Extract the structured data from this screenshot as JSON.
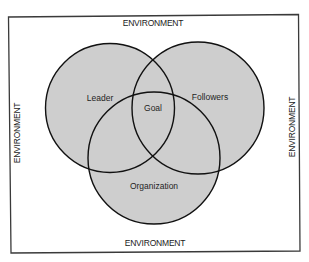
{
  "diagram": {
    "type": "venn",
    "frame": {
      "stroke": "#3a3a3a",
      "background": "#ffffff"
    },
    "environment_labels": {
      "top": "ENVIRONMENT",
      "bottom": "ENVIRONMENT",
      "left": "ENVIRONMENT",
      "right": "ENVIRONMENT"
    },
    "sets": [
      {
        "id": "leader",
        "label": "Leader"
      },
      {
        "id": "followers",
        "label": "Followers"
      },
      {
        "id": "organization",
        "label": "Organization"
      }
    ],
    "intersection": {
      "label": "Goal"
    },
    "colors": {
      "circle_fill": "#cecece",
      "circle_stroke": "#111111"
    }
  }
}
